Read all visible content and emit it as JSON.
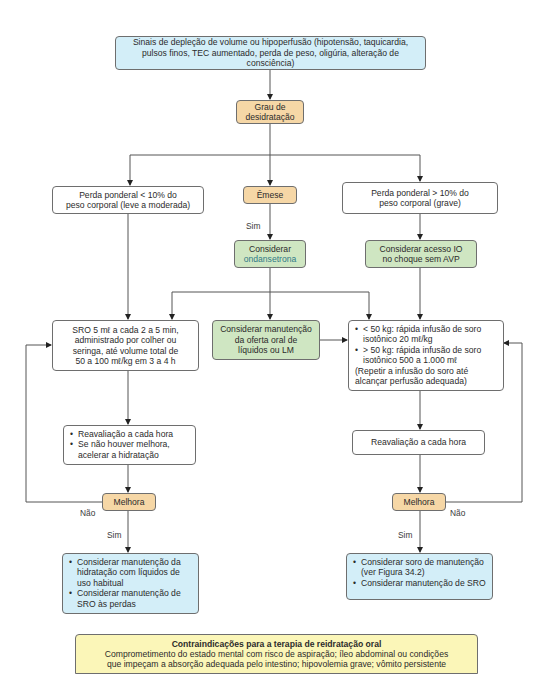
{
  "diagram": {
    "type": "flowchart",
    "topic": "Reidratação / manejo da desidratação",
    "colors": {
      "start_box": "#d3eef8",
      "decision_box": "#f6d7a6",
      "action_box": "#cfe6c2",
      "outcome_box": "#d3eef8",
      "contraindication_box": "#fbf6b8",
      "neutral_box": "#ffffff",
      "line": "#555555"
    },
    "start": {
      "line1": "Sinais de depleção de volume ou hipoperfusão (hipotensão, taquicardia,",
      "line2": "pulsos finos, TEC aumentado, perda de peso, oligúria, alteração de consciência)"
    },
    "grau": {
      "line1": "Grau de",
      "line2": "desidratação"
    },
    "left_branch": {
      "condition": {
        "line1": "Perda ponderal < 10% do",
        "line2": "peso corporal (leve a moderada)"
      },
      "sro": {
        "line1": "SRO 5 mℓ a cada 2 a 5 min,",
        "line2": "administrado por colher ou",
        "line3": "seringa, até volume total de",
        "line4": "50 a 100 mℓ/kg em 3 a 4 h"
      },
      "reavaliacao": {
        "items": [
          "Reavaliação a cada hora",
          "Se não houver melhora, acelerar a hidratação"
        ]
      },
      "melhora": "Melhora",
      "nao_label": "Não",
      "sim_label": "Sim",
      "outcome": {
        "items": [
          "Considerar manutenção da hidratação com líquidos de uso habitual",
          "Considerar manutenção de SRO às perdas"
        ]
      }
    },
    "middle_branch": {
      "emese": "Êmese",
      "sim_label": "Sim",
      "ondansetrona": {
        "line1": "Considerar",
        "line2": "ondansetrona"
      },
      "manutencao": {
        "line1": "Considerar manutenção",
        "line2": "da oferta oral de",
        "line3": "líquidos ou LM"
      }
    },
    "right_branch": {
      "condition": {
        "line1": "Perda ponderal > 10% do",
        "line2": "peso corporal (grave)"
      },
      "acesso": {
        "line1": "Considerar acesso IO",
        "line2": "no choque sem AVP"
      },
      "dose": {
        "items": [
          "< 50 kg: rápida infusão de soro isotônico 20 mℓ/kg",
          "> 50 kg: rápida infusão de soro isotônico 500 a 1.000 mℓ"
        ],
        "note": "(Repetir a infusão do soro até alcançar perfusão adequada)"
      },
      "reavaliacao": "Reavaliação a cada hora",
      "melhora": "Melhora",
      "nao_label": "Não",
      "sim_label": "Sim",
      "outcome": {
        "items": [
          "Considerar soro de manutenção (ver Figura 34.2)",
          "Considerar manutenção de SRO"
        ]
      }
    },
    "contraindicacoes": {
      "title": "Contraindicações para a terapia de reidratação oral",
      "line1": "Comprometimento do estado mental com risco de aspiração; íleo abdominal ou condições",
      "line2": "que impeçam a absorção adequada pelo intestino; hipovolemia grave; vômito persistente"
    }
  }
}
